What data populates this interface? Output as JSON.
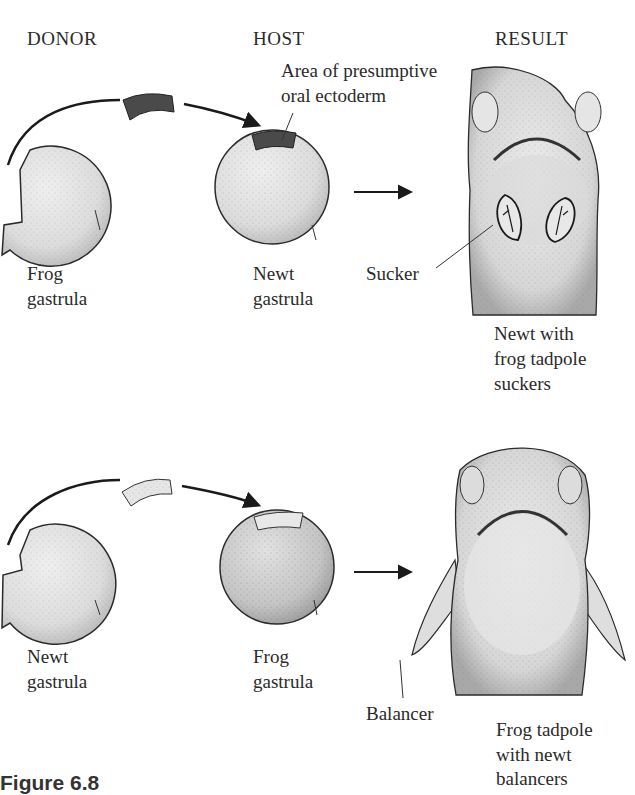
{
  "headers": {
    "donor": "DONOR",
    "host": "HOST",
    "result": "RESULT"
  },
  "top_row": {
    "donor_label": [
      "Frog",
      "gastrula"
    ],
    "host_label": [
      "Newt",
      "gastrula"
    ],
    "host_annotation": [
      "Area of presumptive",
      "oral ectoderm"
    ],
    "result_pointer": "Sucker",
    "result_caption": [
      "Newt with",
      "frog tadpole",
      "suckers"
    ],
    "graft_color": "#4a4a4a"
  },
  "bottom_row": {
    "donor_label": [
      "Newt",
      "gastrula"
    ],
    "host_label": [
      "Frog",
      "gastrula"
    ],
    "result_pointer": "Balancer",
    "result_caption": [
      "Frog tadpole",
      "with newt",
      "balancers"
    ],
    "graft_color": "#e6e6e6"
  },
  "figure_label": "Figure 6.8",
  "colors": {
    "embryo_fill": "#e2e2e2",
    "outline": "#2a2a2a",
    "stipple": "#777777"
  }
}
